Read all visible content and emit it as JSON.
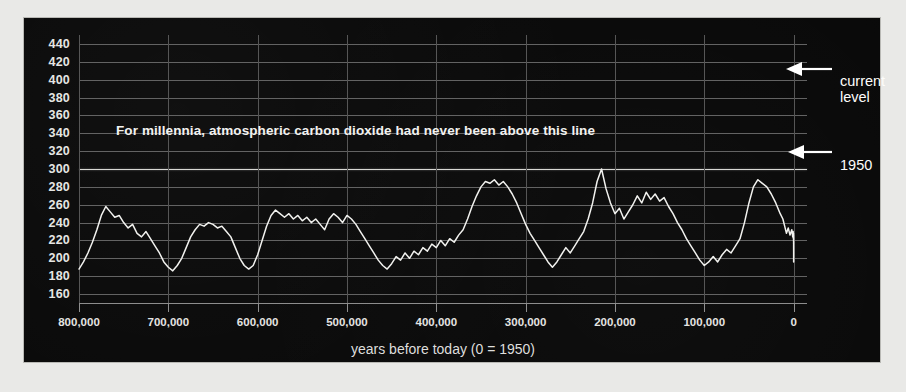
{
  "chart_data": {
    "type": "line",
    "title": "",
    "xlabel": "years before today (0 = 1950)",
    "ylabel": "",
    "xlim": [
      800000,
      -15000
    ],
    "ylim": [
      150,
      450
    ],
    "grid": true,
    "legend": null,
    "background": "#090909",
    "line_color": "#f2f2ef",
    "reference_line": {
      "value": 300,
      "color": "#d8d8d4",
      "label": "For millennia, atmospheric carbon dioxide had never been above this line"
    },
    "y_ticks": [
      440,
      420,
      400,
      380,
      360,
      340,
      320,
      300,
      280,
      260,
      240,
      220,
      200,
      180,
      160
    ],
    "x_ticks": [
      800000,
      700000,
      600000,
      500000,
      400000,
      300000,
      200000,
      100000,
      0
    ],
    "x_tick_labels": [
      "800,000",
      "700,000",
      "600,000",
      "500,000",
      "400,000",
      "300,000",
      "200,000",
      "100,000",
      "0"
    ],
    "annotations": [
      {
        "name": "current-level",
        "text": "current\nlevel",
        "value": 410,
        "arrow": "left"
      },
      {
        "name": "year-1950",
        "text": "1950",
        "value": 310,
        "arrow": "left"
      }
    ],
    "series_name": "Atmospheric CO2 (ppm)",
    "x": [
      800000,
      795000,
      790000,
      785000,
      780000,
      775000,
      770000,
      765000,
      760000,
      755000,
      750000,
      745000,
      740000,
      735000,
      730000,
      725000,
      720000,
      715000,
      710000,
      705000,
      700000,
      695000,
      690000,
      685000,
      680000,
      675000,
      670000,
      665000,
      660000,
      655000,
      650000,
      645000,
      640000,
      635000,
      630000,
      625000,
      620000,
      615000,
      610000,
      605000,
      600000,
      595000,
      590000,
      585000,
      580000,
      575000,
      570000,
      565000,
      560000,
      555000,
      550000,
      545000,
      540000,
      535000,
      530000,
      525000,
      520000,
      515000,
      510000,
      505000,
      500000,
      495000,
      490000,
      485000,
      480000,
      475000,
      470000,
      465000,
      460000,
      455000,
      450000,
      445000,
      440000,
      435000,
      430000,
      425000,
      420000,
      415000,
      410000,
      405000,
      400000,
      395000,
      390000,
      385000,
      380000,
      375000,
      370000,
      365000,
      360000,
      355000,
      350000,
      345000,
      340000,
      335000,
      330000,
      325000,
      320000,
      315000,
      310000,
      305000,
      300000,
      295000,
      290000,
      285000,
      280000,
      275000,
      270000,
      265000,
      260000,
      255000,
      250000,
      245000,
      240000,
      235000,
      230000,
      225000,
      220000,
      215000,
      210000,
      205000,
      200000,
      195000,
      190000,
      185000,
      180000,
      175000,
      170000,
      165000,
      160000,
      155000,
      150000,
      145000,
      140000,
      135000,
      130000,
      125000,
      120000,
      115000,
      110000,
      105000,
      100000,
      95000,
      90000,
      85000,
      80000,
      75000,
      70000,
      65000,
      60000,
      55000,
      50000,
      45000,
      40000,
      35000,
      30000,
      25000,
      20000,
      15000,
      12000,
      10000,
      8000,
      6000,
      4000,
      2000,
      1000,
      500,
      200,
      100,
      50,
      20,
      0,
      -10,
      -20,
      -30,
      -40,
      -50,
      -60,
      -65
    ],
    "y": [
      188,
      196,
      206,
      218,
      232,
      248,
      258,
      252,
      246,
      248,
      240,
      234,
      238,
      228,
      224,
      230,
      222,
      214,
      206,
      196,
      190,
      186,
      192,
      200,
      212,
      224,
      232,
      238,
      236,
      240,
      238,
      234,
      236,
      230,
      224,
      212,
      200,
      192,
      188,
      192,
      204,
      220,
      236,
      248,
      254,
      250,
      246,
      250,
      244,
      248,
      242,
      246,
      240,
      244,
      238,
      232,
      244,
      250,
      246,
      240,
      248,
      244,
      238,
      230,
      222,
      214,
      206,
      198,
      192,
      188,
      194,
      202,
      198,
      206,
      200,
      208,
      204,
      212,
      208,
      216,
      212,
      220,
      214,
      222,
      218,
      226,
      232,
      244,
      258,
      270,
      280,
      286,
      284,
      288,
      282,
      286,
      280,
      272,
      262,
      250,
      238,
      228,
      220,
      212,
      204,
      196,
      190,
      196,
      204,
      212,
      206,
      214,
      222,
      230,
      244,
      262,
      286,
      300,
      278,
      262,
      250,
      256,
      244,
      252,
      260,
      270,
      262,
      274,
      266,
      272,
      264,
      268,
      258,
      250,
      240,
      232,
      222,
      214,
      206,
      198,
      192,
      196,
      202,
      196,
      204,
      210,
      206,
      214,
      222,
      240,
      262,
      280,
      288,
      284,
      280,
      272,
      262,
      250,
      244,
      236,
      228,
      234,
      226,
      232,
      224,
      230,
      222,
      228,
      220,
      226,
      218,
      224,
      216,
      222,
      214,
      208,
      202,
      196,
      190,
      186,
      190,
      196,
      204,
      212,
      222,
      238,
      254,
      262,
      268,
      274,
      270,
      276,
      272,
      278,
      274,
      280,
      276,
      280,
      278,
      282,
      280,
      284,
      282,
      286,
      290,
      296,
      305,
      318,
      334,
      352,
      368,
      382,
      396,
      404,
      410
    ]
  }
}
